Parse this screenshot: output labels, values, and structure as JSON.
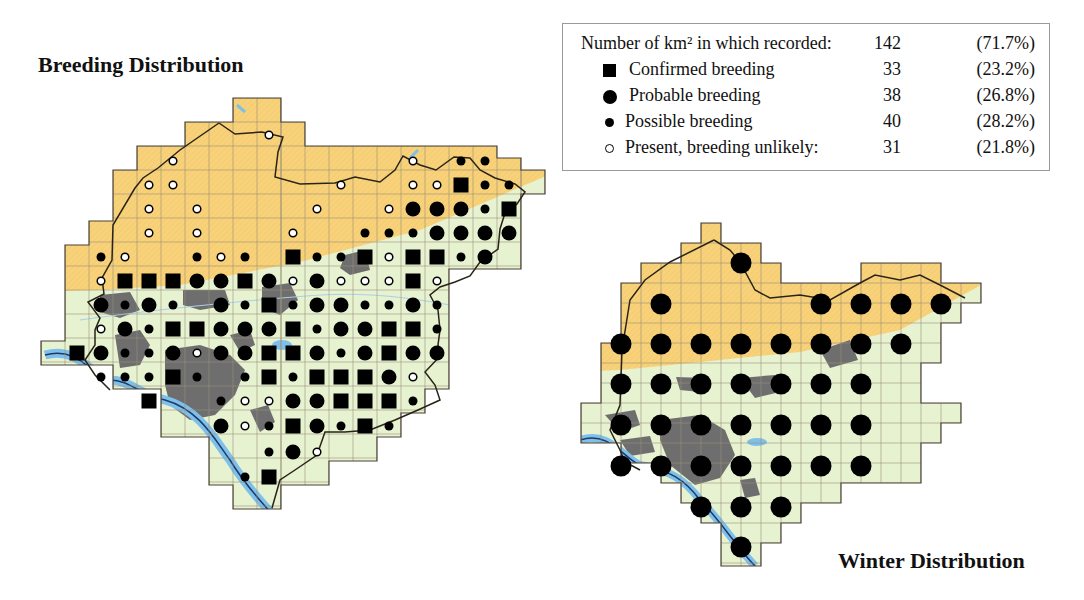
{
  "titles": {
    "breeding": "Breeding Distribution",
    "winter": "Winter Distribution"
  },
  "legend": {
    "header": {
      "label": "Number of km² in which recorded:",
      "count": "142",
      "percent": "(71.7%)"
    },
    "items": [
      {
        "symbol": "square",
        "label": "Confirmed breeding",
        "count": "33",
        "percent": "(23.2%)"
      },
      {
        "symbol": "big-dot",
        "label": "Probable breeding",
        "count": "38",
        "percent": "(26.8%)"
      },
      {
        "symbol": "small-dot",
        "label": "Possible breeding",
        "count": "40",
        "percent": "(28.2%)"
      },
      {
        "symbol": "open-circle",
        "label": "Present, breeding unlikely:",
        "count": "31",
        "percent": "(21.8%)"
      }
    ]
  },
  "colors": {
    "upland": "#F8D27A",
    "lowland": "#E6F2D0",
    "urban": "#6E6E6E",
    "water": "#7EC0EA",
    "boundary": "#2a2418",
    "grid": "#9c9278",
    "symbol": "#000000"
  },
  "breeding_map": {
    "cell_size_px": 24,
    "records": [
      {
        "x": 413,
        "y": 161,
        "t": "P"
      },
      {
        "x": 461,
        "y": 161,
        "t": "s"
      },
      {
        "x": 485,
        "y": 161,
        "t": "s"
      },
      {
        "x": 269,
        "y": 135,
        "t": "P"
      },
      {
        "x": 173,
        "y": 161,
        "t": "P"
      },
      {
        "x": 149,
        "y": 185,
        "t": "P"
      },
      {
        "x": 173,
        "y": 185,
        "t": "P"
      },
      {
        "x": 341,
        "y": 185,
        "t": "P"
      },
      {
        "x": 413,
        "y": 185,
        "t": "P"
      },
      {
        "x": 437,
        "y": 185,
        "t": "P"
      },
      {
        "x": 461,
        "y": 185,
        "t": "C"
      },
      {
        "x": 485,
        "y": 185,
        "t": "s"
      },
      {
        "x": 509,
        "y": 185,
        "t": "s"
      },
      {
        "x": 149,
        "y": 209,
        "t": "P"
      },
      {
        "x": 197,
        "y": 209,
        "t": "P"
      },
      {
        "x": 317,
        "y": 209,
        "t": "P"
      },
      {
        "x": 389,
        "y": 209,
        "t": "P"
      },
      {
        "x": 413,
        "y": 209,
        "t": "B"
      },
      {
        "x": 437,
        "y": 209,
        "t": "B"
      },
      {
        "x": 461,
        "y": 209,
        "t": "B"
      },
      {
        "x": 485,
        "y": 209,
        "t": "s"
      },
      {
        "x": 509,
        "y": 209,
        "t": "C"
      },
      {
        "x": 149,
        "y": 233,
        "t": "P"
      },
      {
        "x": 197,
        "y": 233,
        "t": "P"
      },
      {
        "x": 293,
        "y": 233,
        "t": "P"
      },
      {
        "x": 365,
        "y": 233,
        "t": "s"
      },
      {
        "x": 389,
        "y": 233,
        "t": "s"
      },
      {
        "x": 413,
        "y": 233,
        "t": "s"
      },
      {
        "x": 437,
        "y": 233,
        "t": "B"
      },
      {
        "x": 461,
        "y": 233,
        "t": "B"
      },
      {
        "x": 485,
        "y": 233,
        "t": "B"
      },
      {
        "x": 509,
        "y": 233,
        "t": "B"
      },
      {
        "x": 101,
        "y": 257,
        "t": "s"
      },
      {
        "x": 125,
        "y": 257,
        "t": "P"
      },
      {
        "x": 197,
        "y": 257,
        "t": "s"
      },
      {
        "x": 221,
        "y": 257,
        "t": "P"
      },
      {
        "x": 245,
        "y": 257,
        "t": "s"
      },
      {
        "x": 293,
        "y": 257,
        "t": "C"
      },
      {
        "x": 317,
        "y": 257,
        "t": "s"
      },
      {
        "x": 341,
        "y": 257,
        "t": "s"
      },
      {
        "x": 365,
        "y": 257,
        "t": "C"
      },
      {
        "x": 389,
        "y": 257,
        "t": "P"
      },
      {
        "x": 413,
        "y": 257,
        "t": "C"
      },
      {
        "x": 437,
        "y": 257,
        "t": "C"
      },
      {
        "x": 461,
        "y": 257,
        "t": "s"
      },
      {
        "x": 485,
        "y": 257,
        "t": "B"
      },
      {
        "x": 101,
        "y": 281,
        "t": "P"
      },
      {
        "x": 125,
        "y": 281,
        "t": "C"
      },
      {
        "x": 149,
        "y": 281,
        "t": "C"
      },
      {
        "x": 173,
        "y": 281,
        "t": "C"
      },
      {
        "x": 197,
        "y": 281,
        "t": "B"
      },
      {
        "x": 221,
        "y": 281,
        "t": "B"
      },
      {
        "x": 245,
        "y": 281,
        "t": "C"
      },
      {
        "x": 269,
        "y": 281,
        "t": "B"
      },
      {
        "x": 293,
        "y": 281,
        "t": "P"
      },
      {
        "x": 317,
        "y": 281,
        "t": "B"
      },
      {
        "x": 341,
        "y": 281,
        "t": "P"
      },
      {
        "x": 365,
        "y": 281,
        "t": "P"
      },
      {
        "x": 389,
        "y": 281,
        "t": "P"
      },
      {
        "x": 413,
        "y": 281,
        "t": "C"
      },
      {
        "x": 437,
        "y": 281,
        "t": "P"
      },
      {
        "x": 101,
        "y": 305,
        "t": "B"
      },
      {
        "x": 125,
        "y": 305,
        "t": "s"
      },
      {
        "x": 149,
        "y": 305,
        "t": "B"
      },
      {
        "x": 173,
        "y": 305,
        "t": "s"
      },
      {
        "x": 221,
        "y": 305,
        "t": "B"
      },
      {
        "x": 245,
        "y": 305,
        "t": "s"
      },
      {
        "x": 269,
        "y": 305,
        "t": "C"
      },
      {
        "x": 293,
        "y": 305,
        "t": "s"
      },
      {
        "x": 317,
        "y": 305,
        "t": "B"
      },
      {
        "x": 341,
        "y": 305,
        "t": "B"
      },
      {
        "x": 365,
        "y": 305,
        "t": "s"
      },
      {
        "x": 389,
        "y": 305,
        "t": "s"
      },
      {
        "x": 413,
        "y": 305,
        "t": "B"
      },
      {
        "x": 437,
        "y": 305,
        "t": "s"
      },
      {
        "x": 101,
        "y": 329,
        "t": "P"
      },
      {
        "x": 125,
        "y": 329,
        "t": "B"
      },
      {
        "x": 149,
        "y": 329,
        "t": "s"
      },
      {
        "x": 173,
        "y": 329,
        "t": "C"
      },
      {
        "x": 197,
        "y": 329,
        "t": "C"
      },
      {
        "x": 221,
        "y": 329,
        "t": "B"
      },
      {
        "x": 245,
        "y": 329,
        "t": "B"
      },
      {
        "x": 269,
        "y": 329,
        "t": "B"
      },
      {
        "x": 293,
        "y": 329,
        "t": "C"
      },
      {
        "x": 317,
        "y": 329,
        "t": "s"
      },
      {
        "x": 341,
        "y": 329,
        "t": "B"
      },
      {
        "x": 365,
        "y": 329,
        "t": "B"
      },
      {
        "x": 389,
        "y": 329,
        "t": "C"
      },
      {
        "x": 413,
        "y": 329,
        "t": "C"
      },
      {
        "x": 437,
        "y": 329,
        "t": "s"
      },
      {
        "x": 77,
        "y": 353,
        "t": "C"
      },
      {
        "x": 101,
        "y": 353,
        "t": "B"
      },
      {
        "x": 125,
        "y": 353,
        "t": "s"
      },
      {
        "x": 149,
        "y": 353,
        "t": "s"
      },
      {
        "x": 173,
        "y": 353,
        "t": "B"
      },
      {
        "x": 197,
        "y": 353,
        "t": "P"
      },
      {
        "x": 221,
        "y": 353,
        "t": "B"
      },
      {
        "x": 245,
        "y": 353,
        "t": "B"
      },
      {
        "x": 269,
        "y": 353,
        "t": "C"
      },
      {
        "x": 293,
        "y": 353,
        "t": "C"
      },
      {
        "x": 317,
        "y": 353,
        "t": "B"
      },
      {
        "x": 341,
        "y": 353,
        "t": "s"
      },
      {
        "x": 365,
        "y": 353,
        "t": "B"
      },
      {
        "x": 389,
        "y": 353,
        "t": "C"
      },
      {
        "x": 413,
        "y": 353,
        "t": "B"
      },
      {
        "x": 437,
        "y": 353,
        "t": "B"
      },
      {
        "x": 101,
        "y": 377,
        "t": "s"
      },
      {
        "x": 125,
        "y": 377,
        "t": "s"
      },
      {
        "x": 149,
        "y": 377,
        "t": "s"
      },
      {
        "x": 173,
        "y": 377,
        "t": "C"
      },
      {
        "x": 197,
        "y": 377,
        "t": "s"
      },
      {
        "x": 245,
        "y": 377,
        "t": "s"
      },
      {
        "x": 269,
        "y": 377,
        "t": "C"
      },
      {
        "x": 293,
        "y": 377,
        "t": "s"
      },
      {
        "x": 317,
        "y": 377,
        "t": "C"
      },
      {
        "x": 341,
        "y": 377,
        "t": "C"
      },
      {
        "x": 365,
        "y": 377,
        "t": "C"
      },
      {
        "x": 389,
        "y": 377,
        "t": "B"
      },
      {
        "x": 413,
        "y": 377,
        "t": "P"
      },
      {
        "x": 149,
        "y": 401,
        "t": "C"
      },
      {
        "x": 221,
        "y": 401,
        "t": "s"
      },
      {
        "x": 245,
        "y": 401,
        "t": "P"
      },
      {
        "x": 269,
        "y": 401,
        "t": "P"
      },
      {
        "x": 293,
        "y": 401,
        "t": "B"
      },
      {
        "x": 317,
        "y": 401,
        "t": "B"
      },
      {
        "x": 341,
        "y": 401,
        "t": "C"
      },
      {
        "x": 365,
        "y": 401,
        "t": "C"
      },
      {
        "x": 389,
        "y": 401,
        "t": "C"
      },
      {
        "x": 413,
        "y": 401,
        "t": "s"
      },
      {
        "x": 221,
        "y": 426,
        "t": "B"
      },
      {
        "x": 245,
        "y": 426,
        "t": "P"
      },
      {
        "x": 269,
        "y": 426,
        "t": "s"
      },
      {
        "x": 293,
        "y": 426,
        "t": "C"
      },
      {
        "x": 317,
        "y": 426,
        "t": "B"
      },
      {
        "x": 341,
        "y": 426,
        "t": "s"
      },
      {
        "x": 365,
        "y": 426,
        "t": "C"
      },
      {
        "x": 389,
        "y": 426,
        "t": "s"
      },
      {
        "x": 269,
        "y": 452,
        "t": "s"
      },
      {
        "x": 293,
        "y": 452,
        "t": "B"
      },
      {
        "x": 317,
        "y": 452,
        "t": "P"
      },
      {
        "x": 245,
        "y": 477,
        "t": "s"
      },
      {
        "x": 269,
        "y": 477,
        "t": "C"
      }
    ]
  },
  "winter_map": {
    "cell_size_px": 40,
    "records": [
      {
        "x": 741,
        "y": 263
      },
      {
        "x": 661,
        "y": 304
      },
      {
        "x": 821,
        "y": 304
      },
      {
        "x": 861,
        "y": 304
      },
      {
        "x": 901,
        "y": 304
      },
      {
        "x": 941,
        "y": 304
      },
      {
        "x": 621,
        "y": 344
      },
      {
        "x": 661,
        "y": 344
      },
      {
        "x": 701,
        "y": 344
      },
      {
        "x": 741,
        "y": 344
      },
      {
        "x": 781,
        "y": 344
      },
      {
        "x": 821,
        "y": 344
      },
      {
        "x": 861,
        "y": 344
      },
      {
        "x": 901,
        "y": 344
      },
      {
        "x": 621,
        "y": 384
      },
      {
        "x": 661,
        "y": 384
      },
      {
        "x": 701,
        "y": 384
      },
      {
        "x": 741,
        "y": 384
      },
      {
        "x": 781,
        "y": 384
      },
      {
        "x": 821,
        "y": 384
      },
      {
        "x": 861,
        "y": 384
      },
      {
        "x": 621,
        "y": 425
      },
      {
        "x": 661,
        "y": 425
      },
      {
        "x": 701,
        "y": 425
      },
      {
        "x": 741,
        "y": 425
      },
      {
        "x": 781,
        "y": 425
      },
      {
        "x": 821,
        "y": 425
      },
      {
        "x": 861,
        "y": 425
      },
      {
        "x": 621,
        "y": 466
      },
      {
        "x": 661,
        "y": 466
      },
      {
        "x": 701,
        "y": 466
      },
      {
        "x": 741,
        "y": 466
      },
      {
        "x": 781,
        "y": 466
      },
      {
        "x": 821,
        "y": 466
      },
      {
        "x": 861,
        "y": 466
      },
      {
        "x": 701,
        "y": 507
      },
      {
        "x": 741,
        "y": 507
      },
      {
        "x": 781,
        "y": 507
      },
      {
        "x": 741,
        "y": 547
      }
    ]
  }
}
